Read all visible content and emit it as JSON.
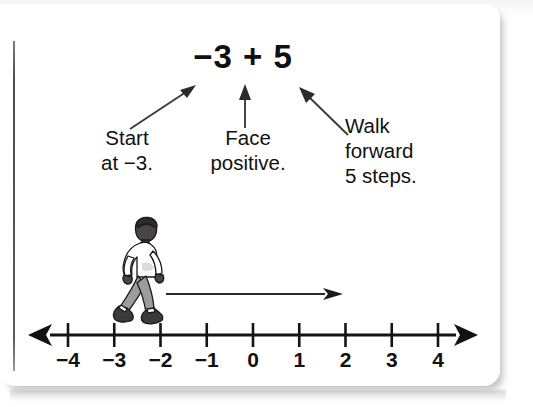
{
  "equation": {
    "text": "−3 + 5"
  },
  "callouts": [
    {
      "id": "start",
      "lines": [
        "Start",
        "at −3."
      ],
      "arrow": "diagonal-up-right"
    },
    {
      "id": "face",
      "lines": [
        "Face",
        "positive."
      ],
      "arrow": "vertical-up"
    },
    {
      "id": "walk",
      "lines": [
        "Walk",
        "forward",
        "5 steps."
      ],
      "arrow": "diagonal-up-left"
    }
  ],
  "figure": {
    "name": "walking-person",
    "direction": "right",
    "position_value": -3,
    "colors": {
      "hair": "#2f2b2a",
      "skin": "#4a4442",
      "shirt": "#ffffff",
      "pants": "#9c9c9c",
      "shoes": "#3a3a3a",
      "outline": "#1a1a1a"
    }
  },
  "motion_arrow": {
    "name": "forward-motion-arrow",
    "direction": "right",
    "from_value": -2,
    "to_value": 2
  },
  "number_line": {
    "min": -4,
    "max": 4,
    "step": 1,
    "left_arrow": true,
    "right_arrow": true,
    "tick_labels": [
      "−4",
      "−3",
      "−2",
      "−1",
      "0",
      "1",
      "2",
      "3",
      "4"
    ],
    "tick_values": [
      -4,
      -3,
      -2,
      -1,
      0,
      1,
      2,
      3,
      4
    ]
  },
  "colors": {
    "ink": "#111111",
    "rule": "#4a4a4a",
    "card": "#ffffff"
  }
}
